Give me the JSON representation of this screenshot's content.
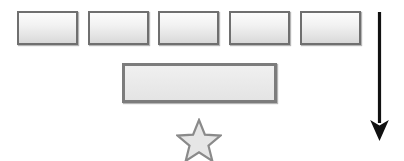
{
  "canvas": {
    "width": 404,
    "height": 161,
    "background_color": "#ffffff"
  },
  "palette": {
    "box_border": "#6f6f6f",
    "box_fill_top": "#fcfcfc",
    "box_fill_bottom": "#d8d8d8",
    "wide_box_border": "#7c7c7c",
    "wide_box_fill": "#eaeaea",
    "star_border": "#8a8a8a",
    "star_fill": "#e6e6e6",
    "arrow_color": "#111111"
  },
  "diagram": {
    "title": "",
    "top_row": {
      "name": "row-of-boxes",
      "count": 5,
      "boxes": [
        {
          "label": "",
          "x": 17,
          "y": 11,
          "width": 61,
          "height": 34
        },
        {
          "label": "",
          "x": 88,
          "y": 11,
          "width": 61,
          "height": 34
        },
        {
          "label": "",
          "x": 158,
          "y": 11,
          "width": 61,
          "height": 34
        },
        {
          "label": "",
          "x": 229,
          "y": 11,
          "width": 61,
          "height": 34
        },
        {
          "label": "",
          "x": 300,
          "y": 11,
          "width": 61,
          "height": 34
        }
      ]
    },
    "wide_box": {
      "name": "wide-bar",
      "label": "",
      "x": 122,
      "y": 63,
      "width": 155,
      "height": 40
    },
    "star": {
      "name": "star-shape",
      "label": "",
      "center_x": 199,
      "center_y": 140,
      "outer_radius": 21,
      "inner_radius": 9,
      "points": 5
    },
    "arrow": {
      "name": "down-arrow",
      "label": "",
      "direction": "down",
      "x": 379,
      "y_start": 12,
      "y_end": 140,
      "line_width": 3,
      "head_width": 19,
      "head_height": 20
    }
  }
}
